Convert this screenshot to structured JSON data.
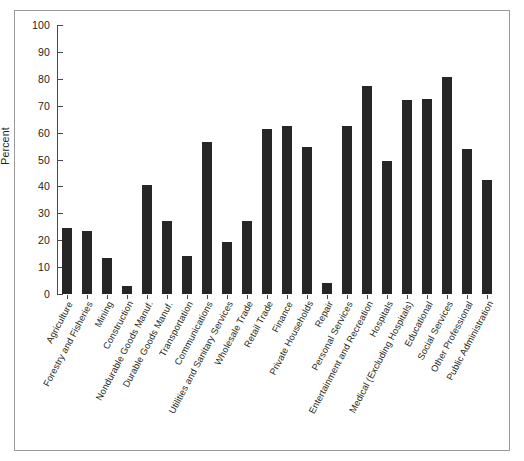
{
  "chart_data": {
    "type": "bar",
    "title": "",
    "xlabel": "",
    "ylabel": "Percent",
    "ylim": [
      0,
      100
    ],
    "yticks": [
      0,
      10,
      20,
      30,
      40,
      50,
      60,
      70,
      80,
      90,
      100
    ],
    "grid": false,
    "legend": "none",
    "bar_color": "#262626",
    "categories": [
      "Agriculture",
      "Forestry and Fisheries",
      "Mining",
      "Construction",
      "Nondurable Goods Manuf.",
      "Durable Goods Manuf.",
      "Transportation",
      "Communications",
      "Utilities and Sanitary Services",
      "Wholesale Trade",
      "Retail Trade",
      "Finance",
      "Private Households",
      "Repair",
      "Personal Services",
      "Entertainment and Recreation",
      "Hospitals",
      "Medical (Excluding Hospitals)",
      "Educational",
      "Social Services",
      "Other Professional",
      "Public Administration"
    ],
    "values": [
      24.5,
      23.5,
      13.5,
      3.0,
      40.5,
      27.0,
      14.0,
      56.5,
      19.5,
      27.0,
      61.5,
      62.5,
      54.5,
      4.0,
      62.5,
      77.5,
      49.5,
      72.0,
      72.5,
      80.5,
      54.0,
      42.5
    ]
  },
  "figure": {
    "border_color": "#9a9a9a",
    "background": "#ffffff"
  }
}
